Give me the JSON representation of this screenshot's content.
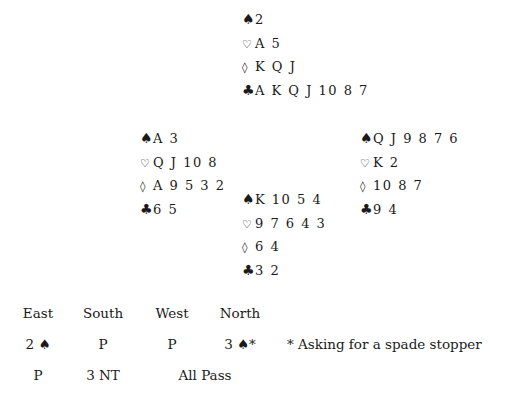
{
  "suit_symbols": {
    "spade": "♠",
    "heart": "♡",
    "diamond": "◊",
    "club": "♣"
  },
  "hands": {
    "north": {
      "spades": "2",
      "hearts": "A 5",
      "diamonds": "K Q J",
      "clubs": "A K Q J 10 8 7"
    },
    "west": {
      "spades": "A 3",
      "hearts": "Q J 10 8",
      "diamonds": "A 9 5 3 2",
      "clubs": "6 5"
    },
    "east": {
      "spades": "Q J 9 8 7 6",
      "hearts": "K 2",
      "diamonds": "10 8 7",
      "clubs": "9 4"
    },
    "south": {
      "spades": "K 10 5 4",
      "hearts": "9 7 6 4 3",
      "diamonds": "6 4",
      "clubs": "3 2"
    }
  },
  "auction": {
    "headers": [
      "East",
      "South",
      "West",
      "North"
    ],
    "rows": [
      [
        "2 ♠",
        "P",
        "P",
        "3 ♠*"
      ],
      [
        "P",
        "3 NT",
        "All Pass",
        ""
      ]
    ],
    "note": "* Asking for a spade stopper"
  }
}
